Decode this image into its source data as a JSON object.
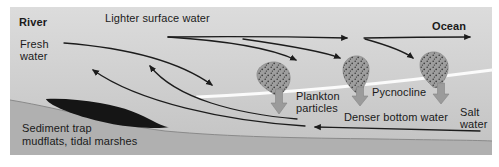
{
  "diagram": {
    "labels": {
      "river": "River",
      "lighter_surface_water": "Lighter surface water",
      "ocean": "Ocean",
      "fresh_water": "Fresh water",
      "plankton_particles": "Plankton particles",
      "pycnocline": "Pycnocline",
      "denser_bottom_water": "Denser bottom water",
      "salt_water": "Salt water",
      "sediment_trap_line1": "Sediment trap",
      "sediment_trap_line2": "mudflats, tidal marshes"
    },
    "colors": {
      "page_background": "#ffffff",
      "water_top": "#dbdbdb",
      "water_bottom": "#c2c2c2",
      "seafloor_fill": "#b0b0b0",
      "seafloor_line": "#8a8a8a",
      "sediment_trap_fill": "#151515",
      "pycnocline_line": "#fbfbfb",
      "flow_arrow": "#1c1c1c",
      "plankton_blob_fill": "#9e9e9e",
      "plankton_stipple": "#3c3c3c",
      "sinking_arrow_fill": "#9b9b9b",
      "text": "#1a1a1a"
    }
  }
}
